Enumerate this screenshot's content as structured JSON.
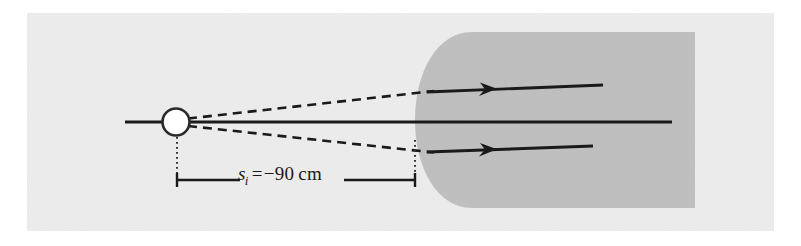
{
  "figure": {
    "type": "optics-ray-diagram",
    "background_color": "#e8e8e8",
    "page_color": "#ffffff",
    "medium_color": "#b3b3b3",
    "line_color": "#1a1a1a",
    "object_point_fill": "#ffffff"
  },
  "dimension": {
    "symbol": "s",
    "subscript": "i",
    "equals": "=",
    "minus": "−",
    "value": "90",
    "unit": "cm",
    "full_label": "s_i = − 90 cm"
  },
  "geometry": {
    "axis": {
      "x1": 125,
      "y1": 122,
      "x2": 672,
      "y2": 122
    },
    "object_point": {
      "cx": 176,
      "cy": 122,
      "r": 14
    },
    "medium": {
      "left_flat_x": 472,
      "right_x": 695,
      "top_y": 32,
      "bottom_y": 208,
      "arc_left_x": 415
    },
    "dashed_rays": [
      {
        "x1": 190,
        "y1": 119,
        "x2": 432,
        "y2": 92
      },
      {
        "x1": 190,
        "y1": 126,
        "x2": 432,
        "y2": 152
      }
    ],
    "solid_rays": [
      {
        "x1": 428,
        "y1": 92,
        "x2": 602,
        "y2": 86,
        "arrow_at": 0.45
      },
      {
        "x1": 428,
        "y1": 152,
        "x2": 592,
        "y2": 146,
        "arrow_at": 0.45
      }
    ],
    "leader_lines": [
      {
        "x": 177,
        "y1": 137,
        "y2": 180
      },
      {
        "x": 415,
        "y1": 140,
        "y2": 180
      }
    ],
    "dimension_bar": {
      "y": 180,
      "x1": 177,
      "x2": 415,
      "tick_half_height": 7
    }
  }
}
